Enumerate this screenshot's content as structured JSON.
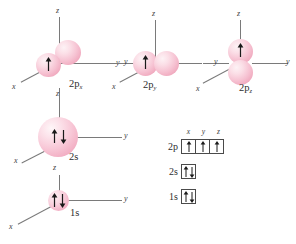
{
  "figure": {
    "background_color": "#ffffff",
    "lobe_color": "#f6c2d2",
    "axis_color": "#7a7a7a",
    "text_color": "#2e2e2e"
  },
  "orbitals": [
    {
      "id": "2px",
      "label": "2p",
      "subscript": "x",
      "axes": [
        {
          "name": "z",
          "label": "z"
        },
        {
          "name": "y",
          "label": "y"
        },
        {
          "name": "x",
          "label": "x"
        }
      ],
      "electrons": "↑",
      "electron_count": 1,
      "lobe_orientation": "x"
    },
    {
      "id": "2py",
      "label": "2p",
      "subscript": "y",
      "axes": [
        {
          "name": "z",
          "label": "z"
        },
        {
          "name": "y",
          "label": "y"
        },
        {
          "name": "x",
          "label": "x"
        }
      ],
      "electrons": "↑",
      "electron_count": 1,
      "lobe_orientation": "y"
    },
    {
      "id": "2pz",
      "label": "2p",
      "subscript": "z",
      "axes": [
        {
          "name": "z",
          "label": "z"
        },
        {
          "name": "y",
          "label": "y"
        },
        {
          "name": "x",
          "label": "x"
        }
      ],
      "electrons": "↑",
      "electron_count": 1,
      "lobe_orientation": "z"
    },
    {
      "id": "2s",
      "label": "2s",
      "subscript": "",
      "axes": [
        {
          "name": "z",
          "label": "z"
        },
        {
          "name": "y",
          "label": "y"
        },
        {
          "name": "x",
          "label": "x"
        }
      ],
      "electrons": "↑↓",
      "electron_count": 2,
      "lobe_orientation": "sphere"
    },
    {
      "id": "1s",
      "label": "1s",
      "subscript": "",
      "axes": [
        {
          "name": "z",
          "label": "z"
        },
        {
          "name": "y",
          "label": "y"
        },
        {
          "name": "x",
          "label": "x"
        }
      ],
      "electrons": "↑↓",
      "electron_count": 2,
      "lobe_orientation": "sphere"
    }
  ],
  "orbital_diagram": {
    "column_headers": [
      "x",
      "y",
      "z"
    ],
    "rows": [
      {
        "label": "2p",
        "boxes": [
          "up",
          "up",
          "up"
        ]
      },
      {
        "label": "2s",
        "boxes": [
          "updown"
        ]
      },
      {
        "label": "1s",
        "boxes": [
          "updown"
        ]
      }
    ]
  }
}
